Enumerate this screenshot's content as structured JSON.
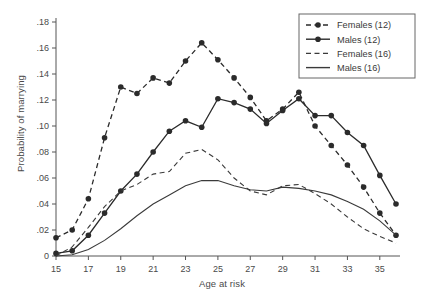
{
  "chart_data": {
    "type": "line",
    "title": "",
    "xlabel": "Age at risk",
    "ylabel": "Probability of marrying",
    "xlim": [
      15,
      36
    ],
    "ylim": [
      0,
      0.18
    ],
    "xticks": [
      15,
      17,
      19,
      21,
      23,
      25,
      27,
      29,
      31,
      33,
      35
    ],
    "yticks": [
      "0",
      ".02",
      ".04",
      ".06",
      ".08",
      ".10",
      ".12",
      ".14",
      ".16",
      ".18"
    ],
    "ytick_values": [
      0,
      0.02,
      0.04,
      0.06,
      0.08,
      0.1,
      0.12,
      0.14,
      0.16,
      0.18
    ],
    "grid": false,
    "legend_position": "top-right",
    "x": [
      15,
      16,
      17,
      18,
      19,
      20,
      21,
      22,
      23,
      24,
      25,
      26,
      27,
      28,
      29,
      30,
      31,
      32,
      33,
      34,
      35,
      36
    ],
    "series": [
      {
        "name": "Females (12)",
        "style": "dashed",
        "markers": true,
        "color": "#2b2b2b",
        "values": [
          0.014,
          0.02,
          0.044,
          0.091,
          0.13,
          0.125,
          0.137,
          0.133,
          0.15,
          0.164,
          0.151,
          0.137,
          0.122,
          0.104,
          0.113,
          0.126,
          0.1,
          0.085,
          0.07,
          0.053,
          0.033,
          0.016
        ]
      },
      {
        "name": "Males (12)",
        "style": "solid",
        "markers": true,
        "color": "#2b2b2b",
        "values": [
          0.002,
          0.004,
          0.016,
          0.033,
          0.05,
          0.063,
          0.08,
          0.096,
          0.104,
          0.099,
          0.121,
          0.118,
          0.113,
          0.102,
          0.112,
          0.121,
          0.108,
          0.108,
          0.095,
          0.085,
          0.062,
          0.04
        ]
      },
      {
        "name": "Females (16)",
        "style": "dashed",
        "markers": false,
        "color": "#3a3a3a",
        "values": [
          0.0,
          0.007,
          0.022,
          0.038,
          0.05,
          0.055,
          0.063,
          0.065,
          0.079,
          0.082,
          0.074,
          0.06,
          0.05,
          0.047,
          0.054,
          0.055,
          0.048,
          0.04,
          0.03,
          0.021,
          0.015,
          0.01
        ]
      },
      {
        "name": "Males (16)",
        "style": "solid",
        "markers": false,
        "color": "#3a3a3a",
        "values": [
          0.0,
          0.001,
          0.005,
          0.012,
          0.021,
          0.031,
          0.04,
          0.047,
          0.054,
          0.058,
          0.058,
          0.054,
          0.051,
          0.05,
          0.053,
          0.052,
          0.05,
          0.047,
          0.042,
          0.036,
          0.027,
          0.016
        ]
      }
    ]
  },
  "legend": {
    "items": [
      {
        "label": "Females (12)"
      },
      {
        "label": "Males (12)"
      },
      {
        "label": "Females (16)"
      },
      {
        "label": "Males (16)"
      }
    ]
  }
}
